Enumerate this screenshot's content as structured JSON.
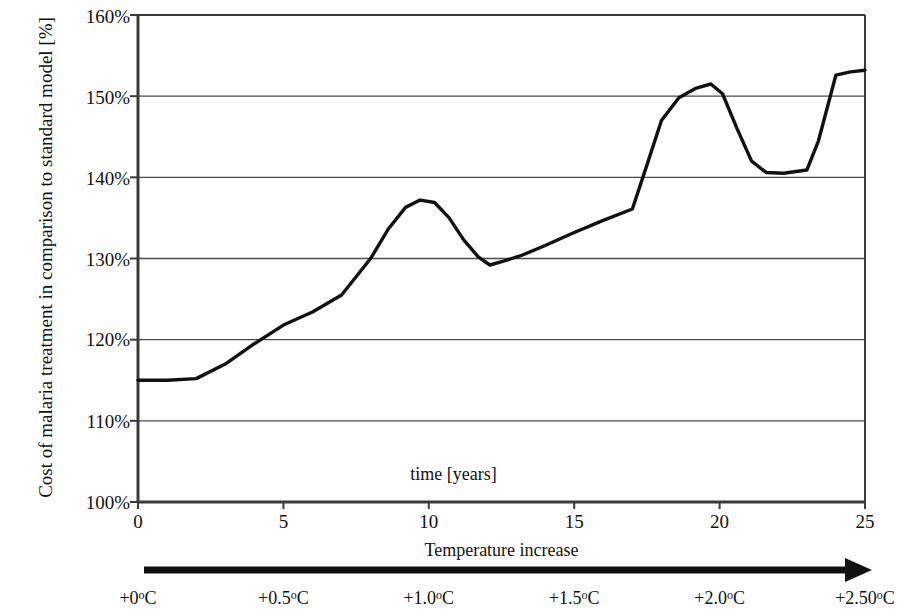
{
  "chart_data": {
    "type": "line",
    "title": "",
    "xlabel": "Temperature increase",
    "ylabel": "Cost of malaria treatment in comparison to standard model [%]",
    "inner_note": "time [years]",
    "xlim": [
      0,
      25
    ],
    "ylim": [
      100,
      160
    ],
    "grid": true,
    "legend": "none",
    "x_tick_labels": [
      "0",
      "5",
      "10",
      "15",
      "20",
      "25"
    ],
    "x_ticks": [
      0,
      5,
      10,
      15,
      20,
      25
    ],
    "y_tick_labels": [
      "100%",
      "110%",
      "120%",
      "130%",
      "140%",
      "150%",
      "160%"
    ],
    "y_ticks": [
      100,
      110,
      120,
      130,
      140,
      150,
      160
    ],
    "secondary_axis": {
      "label": "Temperature increase",
      "arrow": "right-arrow",
      "tick_labels": [
        "+0",
        "+0.5",
        "+1.0",
        "+1.5",
        "+2.0",
        "+2.50"
      ],
      "tick_unit": "ºC",
      "tick_positions": [
        0,
        5,
        10,
        15,
        20,
        25
      ]
    },
    "series": [
      {
        "name": "Cost of malaria treatment",
        "color": "#111111",
        "x": [
          0,
          1,
          2,
          3,
          4,
          5,
          6,
          7,
          8,
          8.6,
          9.2,
          9.7,
          10.2,
          10.7,
          11.2,
          11.7,
          12.1,
          12.6,
          13.2,
          14,
          15,
          16,
          17,
          17.5,
          18,
          18.6,
          19.2,
          19.7,
          20.1,
          20.6,
          21.1,
          21.6,
          22.2,
          23,
          23.4,
          24,
          24.5,
          25
        ],
        "y": [
          115.0,
          115.0,
          115.2,
          117.0,
          119.5,
          121.8,
          123.4,
          125.5,
          130.0,
          133.6,
          136.3,
          137.2,
          136.9,
          135.0,
          132.3,
          130.2,
          129.2,
          129.7,
          130.4,
          131.6,
          133.2,
          134.7,
          136.1,
          141.5,
          147.0,
          149.8,
          151.0,
          151.5,
          150.3,
          146.0,
          142.0,
          140.6,
          140.5,
          140.9,
          144.5,
          152.6,
          153.0,
          153.2
        ]
      }
    ]
  },
  "axis": {
    "y_title_line1": "Cost of malaria treatment in comparison to",
    "y_title_line2": "standard model [%]"
  }
}
